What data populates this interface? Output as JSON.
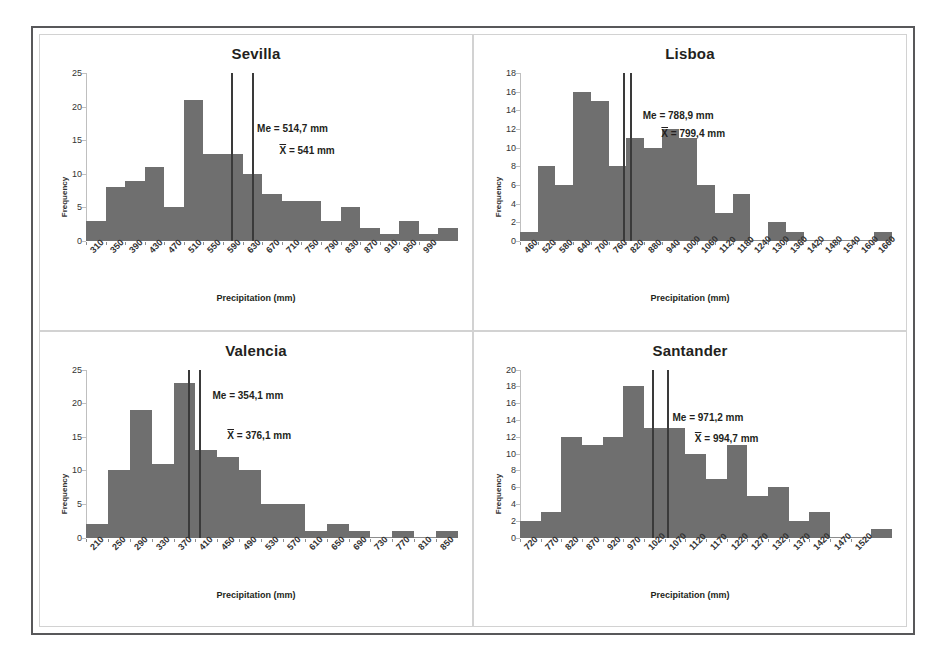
{
  "figure": {
    "panel_count": 4,
    "bar_color": "#6f6f6f",
    "frame_color": "#58585a",
    "panel_border_color": "#d2d2d2"
  },
  "charts": [
    {
      "id": "sevilla",
      "title": "Sevilla",
      "xlabel": "Precipitation (mm)",
      "ylabel": "Frequency",
      "type": "bar",
      "ylim": [
        0,
        25
      ],
      "yticks": [
        0,
        5,
        10,
        15,
        20,
        25
      ],
      "categories": [
        310,
        350,
        390,
        430,
        470,
        510,
        550,
        590,
        630,
        670,
        710,
        750,
        790,
        830,
        870,
        910,
        950,
        990
      ],
      "values": [
        3,
        8,
        9,
        11,
        5,
        21,
        13,
        13,
        10,
        7,
        6,
        6,
        3,
        5,
        2,
        1,
        3,
        1,
        2
      ],
      "median_label": "Me = 514,7 mm",
      "mean_label": "= 541 mm",
      "mean_symbol": "X",
      "median_value": 514.7,
      "mean_value": 541,
      "median_line_pct": 39.0,
      "mean_line_pct": 44.5,
      "annot_median_left_pct": 46,
      "annot_median_top_pct": 30,
      "annot_mean_left_pct": 52,
      "annot_mean_top_pct": 43
    },
    {
      "id": "lisboa",
      "title": "Lisboa",
      "xlabel": "Precipitation (mm)",
      "ylabel": "Frequency",
      "type": "bar",
      "ylim": [
        0,
        18
      ],
      "yticks": [
        0,
        2,
        4,
        6,
        8,
        10,
        12,
        14,
        16,
        18
      ],
      "categories": [
        460,
        520,
        580,
        640,
        700,
        760,
        820,
        880,
        940,
        1000,
        1060,
        1120,
        1180,
        1240,
        1300,
        1360,
        1420,
        1480,
        1540,
        1600,
        1660
      ],
      "values": [
        1,
        8,
        6,
        16,
        15,
        8,
        11,
        10,
        12,
        11,
        6,
        3,
        5,
        0,
        2,
        1,
        0,
        0,
        0,
        0,
        1
      ],
      "median_label": "Me = 788,9 mm",
      "mean_label": "= 799,4 mm",
      "mean_symbol": "X",
      "median_value": 788.9,
      "mean_value": 799.4,
      "median_line_pct": 27.8,
      "mean_line_pct": 29.5,
      "annot_median_left_pct": 33,
      "annot_median_top_pct": 22,
      "annot_mean_left_pct": 38,
      "annot_mean_top_pct": 33
    },
    {
      "id": "valencia",
      "title": "Valencia",
      "xlabel": "Precipitation (mm)",
      "ylabel": "Frequency",
      "type": "bar",
      "ylim": [
        0,
        25
      ],
      "yticks": [
        0,
        5,
        10,
        15,
        20,
        25
      ],
      "categories": [
        210,
        250,
        290,
        330,
        370,
        410,
        450,
        490,
        530,
        570,
        610,
        650,
        690,
        730,
        770,
        810,
        850
      ],
      "values": [
        2,
        10,
        19,
        11,
        23,
        13,
        12,
        10,
        5,
        5,
        1,
        2,
        1,
        0,
        1,
        0,
        1
      ],
      "median_label": "Me = 354,1 mm",
      "mean_label": "= 376,1 mm",
      "mean_symbol": "X",
      "median_value": 354.1,
      "mean_value": 376.1,
      "median_line_pct": 27.5,
      "mean_line_pct": 30.5,
      "annot_median_left_pct": 34,
      "annot_median_top_pct": 12,
      "annot_mean_left_pct": 38,
      "annot_mean_top_pct": 36
    },
    {
      "id": "santander",
      "title": "Santander",
      "xlabel": "Precipitation (mm)",
      "ylabel": "Frequency",
      "type": "bar",
      "ylim": [
        0,
        20
      ],
      "yticks": [
        0,
        2,
        4,
        6,
        8,
        10,
        12,
        14,
        16,
        18,
        20
      ],
      "categories": [
        720,
        770,
        820,
        870,
        920,
        970,
        1020,
        1070,
        1120,
        1170,
        1220,
        1270,
        1320,
        1370,
        1420,
        1470,
        1520
      ],
      "values": [
        2,
        3,
        12,
        11,
        12,
        18,
        13,
        13,
        10,
        7,
        11,
        5,
        6,
        2,
        3,
        0,
        0,
        1
      ],
      "median_label": "Me = 971,2 mm",
      "mean_label": "= 994,7 mm",
      "mean_symbol": "X",
      "median_value": 971.2,
      "mean_value": 994.7,
      "median_line_pct": 35.5,
      "mean_line_pct": 39.5,
      "annot_median_left_pct": 41,
      "annot_median_top_pct": 25,
      "annot_mean_left_pct": 47,
      "annot_mean_top_pct": 38
    }
  ]
}
